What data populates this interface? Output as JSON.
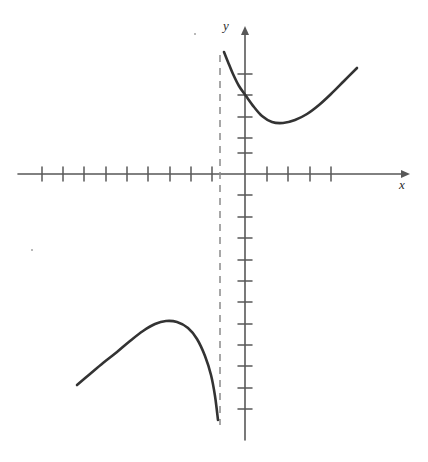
{
  "figure": {
    "title": "",
    "background_color": "#ffffff",
    "width": 428,
    "height": 462
  },
  "axes": {
    "x_label": "x",
    "y_label": "y",
    "axis_color": "#585858",
    "origin": {
      "x": 245,
      "y": 174
    },
    "tick_spacing_px": 21.3,
    "x_axis": {
      "start_px": 18,
      "end_px": 408,
      "arrow": "right",
      "ticks_left_count": 10,
      "ticks_right_count": 4,
      "tick_half_length_px": 6
    },
    "y_axis": {
      "start_px": 28,
      "end_px": 440,
      "arrow": "up",
      "ticks_above_count": 5,
      "ticks_below_count": 12,
      "tick_half_length_px": 6
    }
  },
  "chart_data": {
    "type": "line",
    "title": "",
    "xlabel": "x",
    "ylabel": "y",
    "grid": false,
    "legend": null,
    "axis_units_per_tick": 1,
    "xlim": [
      -10.6,
      7.7
    ],
    "ylim": [
      -12.5,
      6.9
    ],
    "annotations": [
      {
        "kind": "vertical-asymptote",
        "style": "dashed",
        "x": -1.17,
        "x_px": 220,
        "y_top_px": 55,
        "y_bottom_px": 425,
        "color": "#8a8a8a"
      }
    ],
    "series": [
      {
        "name": "upper-branch",
        "style": "solid",
        "color": "#333333",
        "width_px": 2.6,
        "description": "Decreasing from vertical asymptote, local minimum, then increasing",
        "points_px": [
          [
            224,
            52
          ],
          [
            228,
            62
          ],
          [
            233,
            74
          ],
          [
            239,
            86
          ],
          [
            246,
            96
          ],
          [
            254,
            107
          ],
          [
            262,
            116
          ],
          [
            272,
            122
          ],
          [
            283,
            123
          ],
          [
            295,
            120
          ],
          [
            307,
            114
          ],
          [
            319,
            105
          ],
          [
            331,
            94
          ],
          [
            344,
            81
          ],
          [
            357,
            68
          ]
        ],
        "points_data": [
          [
            -0.99,
            5.73
          ],
          [
            -0.8,
            5.26
          ],
          [
            -0.56,
            4.69
          ],
          [
            -0.28,
            4.13
          ],
          [
            0.05,
            3.66
          ],
          [
            0.42,
            3.15
          ],
          [
            0.8,
            2.72
          ],
          [
            1.27,
            2.44
          ],
          [
            1.78,
            2.39
          ],
          [
            2.35,
            2.54
          ],
          [
            2.91,
            2.82
          ],
          [
            3.47,
            3.24
          ],
          [
            4.04,
            3.76
          ],
          [
            4.65,
            4.37
          ],
          [
            5.26,
            4.98
          ]
        ],
        "local_minimum_px": [
          277,
          123
        ],
        "local_minimum_data": [
          1.5,
          2.39
        ]
      },
      {
        "name": "lower-branch",
        "style": "solid",
        "color": "#333333",
        "width_px": 2.6,
        "description": "Increasing to local maximum then decreasing steeply toward asymptote",
        "points_px": [
          [
            77,
            385
          ],
          [
            90,
            374
          ],
          [
            103,
            363
          ],
          [
            117,
            352
          ],
          [
            130,
            341
          ],
          [
            143,
            331
          ],
          [
            155,
            324
          ],
          [
            166,
            321
          ],
          [
            177,
            322
          ],
          [
            188,
            328
          ],
          [
            197,
            339
          ],
          [
            205,
            356
          ],
          [
            211,
            375
          ],
          [
            215,
            396
          ],
          [
            218,
            420
          ]
        ],
        "points_data": [
          [
            -7.89,
            -9.91
          ],
          [
            -7.28,
            -9.39
          ],
          [
            -6.67,
            -8.87
          ],
          [
            -6.01,
            -8.36
          ],
          [
            -5.4,
            -7.84
          ],
          [
            -4.79,
            -7.37
          ],
          [
            -4.23,
            -7.04
          ],
          [
            -3.71,
            -6.9
          ],
          [
            -3.19,
            -6.95
          ],
          [
            -2.68,
            -7.23
          ],
          [
            -2.25,
            -7.75
          ],
          [
            -1.88,
            -8.54
          ],
          [
            -1.6,
            -9.44
          ],
          [
            -1.41,
            -10.42
          ],
          [
            -1.27,
            -11.55
          ]
        ],
        "local_maximum_px": [
          166,
          321
        ],
        "local_maximum_data": [
          -3.71,
          -6.9
        ]
      }
    ]
  },
  "artifacts": {
    "speck_top": "scan-speck",
    "speck_left": "scan-speck"
  }
}
